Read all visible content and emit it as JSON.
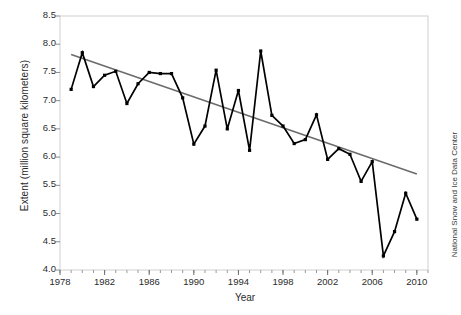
{
  "chart_data": {
    "type": "line",
    "title": "",
    "xlabel": "Year",
    "ylabel": "Extent (million square kilometers)",
    "credit": "National Snow and Ice Data Center",
    "xlim": [
      1978,
      2011
    ],
    "ylim": [
      4.0,
      8.5
    ],
    "grid": false,
    "legend": "none",
    "y_ticks": [
      "4.0",
      "4.5",
      "5.0",
      "5.5",
      "6.0",
      "6.5",
      "7.0",
      "7.5",
      "8.0",
      "8.5"
    ],
    "y_tick_values": [
      4.0,
      4.5,
      5.0,
      5.5,
      6.0,
      6.5,
      7.0,
      7.5,
      8.0,
      8.5
    ],
    "x_ticks": [
      "1978",
      "1982",
      "1986",
      "1990",
      "1994",
      "1998",
      "2002",
      "2006",
      "2010"
    ],
    "x_tick_values": [
      1978,
      1982,
      1986,
      1990,
      1994,
      1998,
      2002,
      2006,
      2010
    ],
    "x_minor_tick_step": 1,
    "series": [
      {
        "name": "Extent",
        "style": "line-with-markers",
        "color": "#000000",
        "x": [
          1979,
          1980,
          1981,
          1982,
          1983,
          1984,
          1985,
          1986,
          1987,
          1988,
          1989,
          1990,
          1991,
          1992,
          1993,
          1994,
          1995,
          1996,
          1997,
          1998,
          1999,
          2000,
          2001,
          2002,
          2003,
          2004,
          2005,
          2006,
          2007,
          2008,
          2009,
          2010
        ],
        "values": [
          7.2,
          7.85,
          7.25,
          7.45,
          7.52,
          6.95,
          7.3,
          7.5,
          7.48,
          7.48,
          7.05,
          6.23,
          6.55,
          7.54,
          6.5,
          7.18,
          6.12,
          7.88,
          6.74,
          6.55,
          6.24,
          6.31,
          6.75,
          5.96,
          6.15,
          6.05,
          5.57,
          5.92,
          4.25,
          4.68,
          5.36,
          4.9
        ]
      },
      {
        "name": "Linear trend",
        "style": "line",
        "color": "#6b6b6b",
        "x": [
          1979,
          2010
        ],
        "values": [
          7.82,
          5.7
        ]
      }
    ]
  }
}
